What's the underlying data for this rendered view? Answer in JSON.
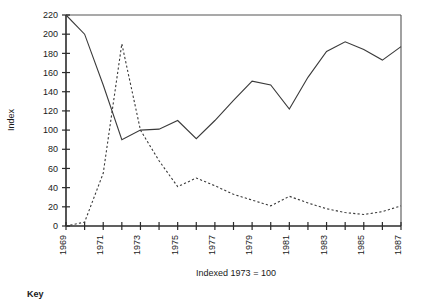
{
  "chart_data": {
    "type": "line",
    "title": "",
    "subtitle": "",
    "xlabel": "Indexed 1973 = 100",
    "ylabel": "Index",
    "xlim": [
      1969,
      1987
    ],
    "ylim": [
      0,
      220
    ],
    "grid": false,
    "legend_position": "below-left",
    "legend_heading": "Key",
    "y_ticks": [
      0,
      20,
      40,
      60,
      80,
      100,
      120,
      140,
      160,
      180,
      200,
      220
    ],
    "x_ticks": [
      1969,
      1970,
      1971,
      1972,
      1973,
      1974,
      1975,
      1976,
      1977,
      1978,
      1979,
      1980,
      1981,
      1982,
      1983,
      1984,
      1985,
      1986,
      1987
    ],
    "x_tick_labels": [
      "1969",
      "",
      "1971",
      "",
      "1973",
      "",
      "1975",
      "",
      "1977",
      "",
      "1979",
      "",
      "1981",
      "",
      "1983",
      "",
      "1985",
      "",
      "1987"
    ],
    "x": [
      1969,
      1970,
      1971,
      1972,
      1973,
      1974,
      1975,
      1976,
      1977,
      1978,
      1979,
      1980,
      1981,
      1982,
      1983,
      1984,
      1985,
      1986,
      1987
    ],
    "series": [
      {
        "name": "series-solid",
        "style": "solid",
        "color": "#3a3a3a",
        "values": [
          220,
          200,
          147,
          90,
          100,
          101,
          110,
          91,
          110,
          131,
          151,
          147,
          122,
          155,
          182,
          192,
          184,
          173,
          187
        ]
      },
      {
        "name": "series-dashed",
        "style": "dashed",
        "color": "#3a3a3a",
        "values": [
          0,
          4,
          55,
          190,
          100,
          68,
          41,
          50,
          42,
          33,
          27,
          21,
          31,
          24,
          18,
          14,
          12,
          15,
          21
        ]
      }
    ]
  }
}
